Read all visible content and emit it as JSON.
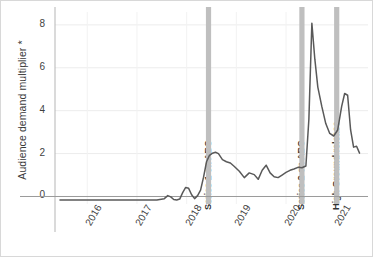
{
  "chart_data": {
    "type": "line",
    "title": "",
    "xlabel": "",
    "ylabel": "Audience demand multiplier *",
    "ylim": [
      -0.35,
      8.6
    ],
    "yticks": [
      0,
      2,
      4,
      6,
      8
    ],
    "ytick_labels": [
      "0",
      "2",
      "4",
      "6",
      "8"
    ],
    "xlim": [
      2015.35,
      2021.65
    ],
    "xticks": [
      2016,
      2017,
      2018,
      2019,
      2020,
      2021
    ],
    "xtick_labels": [
      "2016",
      "2017",
      "2018",
      "2019",
      "2020",
      "2021"
    ],
    "grid": "horizontal-faint",
    "legend": "none",
    "line_color": "#595959",
    "marker_band_color": "#bfbfbf",
    "series": [
      {
        "name": "Audience demand multiplier",
        "x": [
          2015.45,
          2015.7,
          2015.95,
          2016.2,
          2016.45,
          2016.7,
          2016.95,
          2017.2,
          2017.4,
          2017.55,
          2017.62,
          2017.68,
          2017.74,
          2017.8,
          2017.86,
          2017.92,
          2017.98,
          2018.04,
          2018.1,
          2018.16,
          2018.22,
          2018.28,
          2018.34,
          2018.4,
          2018.46,
          2018.52,
          2018.58,
          2018.64,
          2018.72,
          2018.8,
          2018.88,
          2018.96,
          2019.06,
          2019.16,
          2019.26,
          2019.36,
          2019.44,
          2019.52,
          2019.6,
          2019.68,
          2019.76,
          2019.84,
          2019.92,
          2020.0,
          2020.08,
          2020.16,
          2020.24,
          2020.32,
          2020.4,
          2020.46,
          2020.52,
          2020.58,
          2020.64,
          2020.72,
          2020.8,
          2020.88,
          2020.96,
          2021.04,
          2021.12,
          2021.18,
          2021.24,
          2021.3,
          2021.36,
          2021.42,
          2021.48
        ],
        "y": [
          -0.16,
          -0.16,
          -0.16,
          -0.16,
          -0.16,
          -0.16,
          -0.16,
          -0.16,
          -0.16,
          -0.1,
          0.04,
          -0.02,
          -0.14,
          -0.16,
          -0.12,
          0.18,
          0.42,
          0.38,
          0.08,
          -0.1,
          0.04,
          0.3,
          0.9,
          1.62,
          1.92,
          2.02,
          2.06,
          2.0,
          1.72,
          1.62,
          1.56,
          1.4,
          1.18,
          0.88,
          1.1,
          1.02,
          0.8,
          1.22,
          1.46,
          1.1,
          0.92,
          0.88,
          1.0,
          1.12,
          1.22,
          1.28,
          1.36,
          1.34,
          1.42,
          3.6,
          8.08,
          6.4,
          5.1,
          4.2,
          3.4,
          2.94,
          2.82,
          3.1,
          4.2,
          4.8,
          4.72,
          3.1,
          2.3,
          2.34,
          2.02
        ]
      }
    ],
    "annotations": [
      {
        "label": "Series 1 on ABC",
        "x": 2018.44,
        "type": "vertical-band"
      },
      {
        "label": "Series 2 on ABC",
        "x": 2020.32,
        "type": "vertical-band"
      },
      {
        "label": "High Ground release",
        "x": 2021.02,
        "type": "vertical-band"
      }
    ]
  }
}
